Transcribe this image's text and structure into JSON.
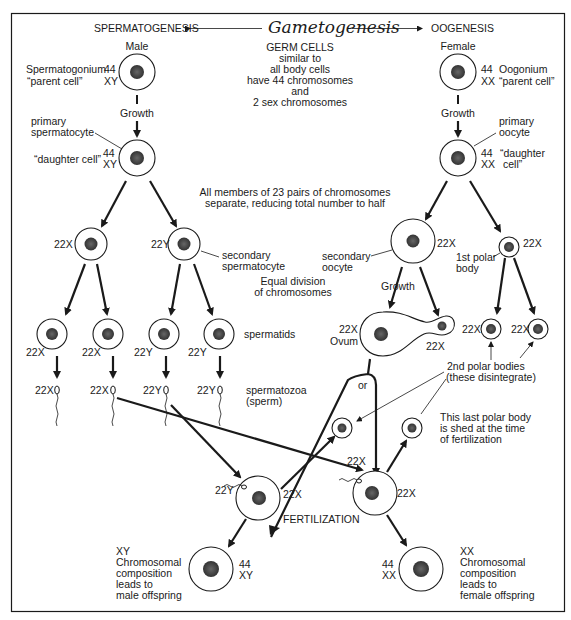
{
  "header": {
    "title": "Gametogenesis",
    "left_label": "SPERMATOGENESIS",
    "right_label": "OOGENESIS"
  },
  "germ_cells": {
    "line1": "GERM CELLS",
    "line2": "similar to",
    "line3": "all body cells",
    "line4": "have 44 chromosomes",
    "line5": "and",
    "line6": "2 sex chromosomes"
  },
  "male": {
    "sex_label": "Male",
    "parent_name": "Spermatogonium",
    "parent_desc": "“parent cell”",
    "parent_autosomes": "44",
    "parent_sex": "XY",
    "growth": "Growth",
    "primary_line1": "primary",
    "primary_line2": "spermatocyte",
    "daughter_desc": "“daughter cell”",
    "daughter_autosomes": "44",
    "daughter_sex": "XY",
    "secondary_left": "22X",
    "secondary_right": "22Y",
    "secondary_line1": "secondary",
    "secondary_line2": "spermatocyte",
    "spermatids_label": "spermatids",
    "spermatids": [
      "22X",
      "22X",
      "22Y",
      "22Y"
    ],
    "sperm": [
      "22X",
      "22X",
      "22Y",
      "22Y"
    ],
    "sperm_line1": "spermatozoa",
    "sperm_line2": "(sperm)"
  },
  "female": {
    "sex_label": "Female",
    "parent_name": "Oogonium",
    "parent_desc": "“parent cell”",
    "parent_autosomes": "44",
    "parent_sex": "XX",
    "growth": "Growth",
    "primary_line1": "primary",
    "primary_line2": "oocyte",
    "daughter_line1": "“daughter",
    "daughter_line2": "cell”",
    "daughter_autosomes": "44",
    "daughter_sex": "XX",
    "secondary_oocyte_line1": "secondary",
    "secondary_oocyte_line2": "oocyte",
    "secondary_oocyte_chrom": "22X",
    "polar1_chrom": "22X",
    "polar1_line1": "1st polar",
    "polar1_line2": "body",
    "growth2": "Growth",
    "ovum_chrom": "22X",
    "ovum_label": "Ovum",
    "ovum_bud_chrom": "22X",
    "polar2_left": "22X",
    "polar2_right": "22X",
    "polar2_line1": "2nd polar bodies",
    "polar2_line2": "(these disintegrate)",
    "or_label": "or",
    "last_polar_line1": "This last polar body",
    "last_polar_line2": "is shed at the time",
    "last_polar_line3": "of fertilization"
  },
  "middle": {
    "reduction_line1": "All members of 23 pairs of chromosomes",
    "reduction_line2": "separate, reducing total number to half",
    "equal_line1": "Equal division",
    "equal_line2": "of chromosomes"
  },
  "fertilization": {
    "label": "FERTILIZATION",
    "left_sperm": "22Y",
    "left_egg": "22X",
    "right_sperm": "22X",
    "right_egg": "22X",
    "male_offspring": {
      "line1": "XY",
      "line2": "Chromosomal",
      "line3": "composition",
      "line4": "leads to",
      "line5": "male offspring",
      "autosomes": "44",
      "sex": "XY"
    },
    "female_offspring": {
      "line1": "XX",
      "line2": "Chromosomal",
      "line3": "composition",
      "line4": "leads to",
      "line5": "female offspring",
      "autosomes": "44",
      "sex": "XX"
    }
  }
}
